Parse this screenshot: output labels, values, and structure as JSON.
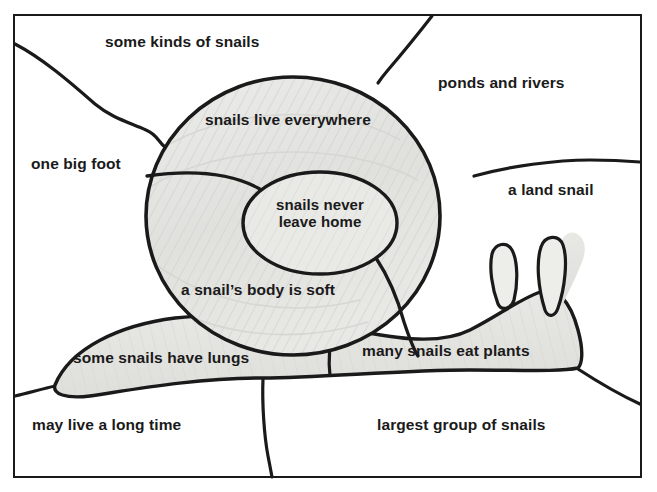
{
  "document": {
    "title": "Snail labelled concept diagram",
    "medium": "hand-drawn pencil and ink on paper (scanned worksheet)",
    "page_background": "#ffffff",
    "ink_color": "#1a1a1a",
    "pencil_shading_color": "#e2e2e0",
    "border": {
      "name": "page-border-rectangle",
      "x": 14,
      "y": 15,
      "width": 627,
      "height": 462,
      "stroke": "#1a1a1a",
      "stroke_width": 2
    }
  },
  "drawing": {
    "subject": "snail",
    "parts": [
      {
        "name": "shell-outer-spiral",
        "shape": "large circle",
        "cx": 293,
        "cy": 216,
        "rx": 147,
        "ry": 139
      },
      {
        "name": "shell-inner-whorl",
        "shape": "oval",
        "cx": 320,
        "cy": 223,
        "rx": 77,
        "ry": 51
      },
      {
        "name": "shell-spiral-divider-upper",
        "shape": "curve from shell-left-edge to inner-oval"
      },
      {
        "name": "shell-spiral-divider-lower",
        "shape": "curve from inner-oval down to shell-bottom"
      },
      {
        "name": "snail-body-foot",
        "shape": "elongated foot sweeping left and right of shell"
      },
      {
        "name": "snail-head",
        "shape": "head at right of body"
      },
      {
        "name": "tentacle-left",
        "shape": "small upright loop"
      },
      {
        "name": "tentacle-right",
        "shape": "taller upright loop"
      },
      {
        "name": "background-divider-upper-left",
        "shape": "wavy line from left border to shell"
      },
      {
        "name": "background-divider-upper-right",
        "shape": "line from top border to shell"
      },
      {
        "name": "background-divider-right",
        "shape": "line from shell to right border"
      },
      {
        "name": "background-divider-lower-left",
        "shape": "line from left border to body tail"
      },
      {
        "name": "background-divider-lower-middle",
        "shape": "line from body down to bottom border"
      },
      {
        "name": "background-divider-lower-right",
        "shape": "line from body to right border"
      }
    ]
  },
  "labels": [
    {
      "id": "some-kinds-of-snails",
      "text": "some kinds of snails",
      "x": 105,
      "y": 41,
      "region": "top background",
      "align": "left"
    },
    {
      "id": "ponds-and-rivers",
      "text": "ponds and rivers",
      "x": 438,
      "y": 82,
      "region": "upper right background",
      "align": "left"
    },
    {
      "id": "snails-live-everywhere",
      "text": "snails live everywhere",
      "x": 205,
      "y": 119,
      "region": "shell upper whorl",
      "align": "left"
    },
    {
      "id": "one-big-foot",
      "text": "one big foot",
      "x": 31,
      "y": 163,
      "region": "left background",
      "align": "left"
    },
    {
      "id": "a-land-snail",
      "text": "a land snail",
      "x": 508,
      "y": 189,
      "region": "right background",
      "align": "left"
    },
    {
      "id": "snails-never-leave-home",
      "text": "snails never\nleave home",
      "x": 320,
      "y": 204,
      "region": "shell inner whorl",
      "align": "center"
    },
    {
      "id": "a-snails-body-is-soft",
      "text": "a snail’s body is soft",
      "x": 181,
      "y": 289,
      "region": "shell lower whorl",
      "align": "left"
    },
    {
      "id": "some-snails-have-lungs",
      "text": "some snails have lungs",
      "x": 73,
      "y": 357,
      "region": "snail foot left",
      "align": "left"
    },
    {
      "id": "many-snails-eat-plants",
      "text": "many snails eat plants",
      "x": 362,
      "y": 350,
      "region": "snail foot right",
      "align": "left"
    },
    {
      "id": "may-live-a-long-time",
      "text": "may live a long time",
      "x": 32,
      "y": 424,
      "region": "bottom left background",
      "align": "left"
    },
    {
      "id": "largest-group-of-snails",
      "text": "largest group of snails",
      "x": 377,
      "y": 424,
      "region": "bottom right background",
      "align": "left"
    }
  ]
}
